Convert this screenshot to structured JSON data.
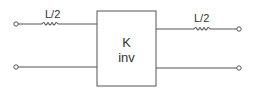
{
  "diagram": {
    "type": "two-port network",
    "block": {
      "line1": "K",
      "line2": "inv"
    },
    "inductors": [
      {
        "label": "L/2",
        "position": "input-top"
      },
      {
        "label": "L/2",
        "position": "output-top"
      }
    ],
    "colors": {
      "line": "#555555",
      "text": "#333333",
      "background": "#ffffff"
    }
  }
}
